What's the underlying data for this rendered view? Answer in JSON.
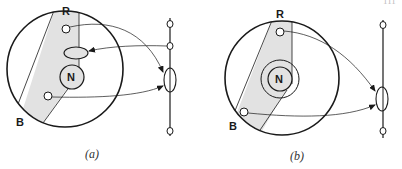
{
  "page_number_fragment": "111",
  "colors": {
    "stroke": "#1a1a1a",
    "band_fill": "#e2e2e2",
    "background": "#ffffff"
  },
  "panels": [
    {
      "id": "a",
      "caption": "(a)",
      "labels": {
        "top": "R",
        "bottom": "B",
        "center": "N"
      },
      "center_element": "single circle",
      "inner_markers": [
        "small circle near R",
        "horizontal ellipse",
        "small circle near B"
      ],
      "axis_nodes": [
        "top node",
        "upper node",
        "ellipse node",
        "bottom node"
      ],
      "arrows": [
        "from R circle to axis ellipse",
        "from axis upper node to inner ellipse",
        "from B circle to axis ellipse"
      ]
    },
    {
      "id": "b",
      "caption": "(b)",
      "labels": {
        "top": "R",
        "bottom": "B",
        "center": "N"
      },
      "center_element": "concentric double circle",
      "inner_markers": [
        "small circle near R",
        "small circle near B"
      ],
      "axis_nodes": [
        "top node",
        "ellipse node",
        "bottom node"
      ],
      "arrows": [
        "from R circle to axis ellipse",
        "from B circle to axis ellipse"
      ]
    }
  ]
}
